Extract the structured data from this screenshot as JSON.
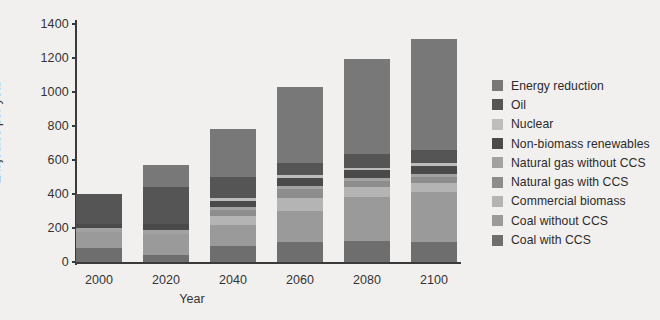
{
  "chart_data": {
    "type": "bar",
    "stacked": true,
    "title": "",
    "xlabel": "Year",
    "ylabel": "Exajoules per year",
    "categories": [
      "2000",
      "2020",
      "2040",
      "2060",
      "2080",
      "2100"
    ],
    "ylim": [
      0,
      1400
    ],
    "yticks": [
      0,
      200,
      400,
      600,
      800,
      1000,
      1200,
      1400
    ],
    "grid": false,
    "legend_position": "right",
    "totals": [
      400,
      570,
      785,
      1030,
      1195,
      1310
    ],
    "series": [
      {
        "name": "Coal with CCS",
        "color": "#6e6e6e",
        "values": [
          80,
          40,
          95,
          120,
          125,
          120
        ]
      },
      {
        "name": "Coal without CCS",
        "color": "#9a9a9a",
        "values": [
          95,
          125,
          120,
          180,
          260,
          290
        ]
      },
      {
        "name": "Commercial biomass",
        "color": "#b4b4b4",
        "values": [
          0,
          0,
          55,
          75,
          55,
          55
        ]
      },
      {
        "name": "Natural gas with CCS",
        "color": "#8d8d8d",
        "values": [
          0,
          0,
          35,
          55,
          35,
          35
        ]
      },
      {
        "name": "Natural gas without CCS",
        "color": "#a2a2a2",
        "values": [
          25,
          25,
          20,
          20,
          20,
          20
        ]
      },
      {
        "name": "Non-biomass renewables",
        "color": "#4a4a4a",
        "values": [
          25,
          35,
          35,
          45,
          45,
          45
        ]
      },
      {
        "name": "Nuclear",
        "color": "#bdbdbd",
        "values": [
          0,
          0,
          15,
          15,
          15,
          15
        ]
      },
      {
        "name": "Oil",
        "color": "#555555",
        "values": [
          175,
          215,
          125,
          75,
          80,
          80
        ]
      },
      {
        "name": "Energy reduction",
        "color": "#787878",
        "values": [
          0,
          130,
          285,
          445,
          560,
          650
        ]
      }
    ]
  },
  "legend": {
    "items": [
      {
        "label": "Energy reduction",
        "color": "#787878"
      },
      {
        "label": "Oil",
        "color": "#555555"
      },
      {
        "label": "Nuclear",
        "color": "#bdbdbd"
      },
      {
        "label": "Non-biomass renewables",
        "color": "#4a4a4a"
      },
      {
        "label": "Natural gas without CCS",
        "color": "#a2a2a2"
      },
      {
        "label": "Natural gas with CCS",
        "color": "#8d8d8d"
      },
      {
        "label": "Commercial biomass",
        "color": "#b4b4b4"
      },
      {
        "label": "Coal without CCS",
        "color": "#9a9a9a"
      },
      {
        "label": "Coal with CCS",
        "color": "#6e6e6e"
      }
    ]
  },
  "axes": {
    "y_title": "Exajoules per year",
    "x_title": "Year",
    "y_tick_labels": [
      "0",
      "200",
      "400",
      "600",
      "800",
      "1000",
      "1200",
      "1400"
    ],
    "x_tick_labels": [
      "2000",
      "2020",
      "2040",
      "2060",
      "2080",
      "2100"
    ]
  },
  "style": {
    "background": "#f2f0ee",
    "axis_color": "#3a3a3a",
    "text_color": "#2b2b2b"
  }
}
